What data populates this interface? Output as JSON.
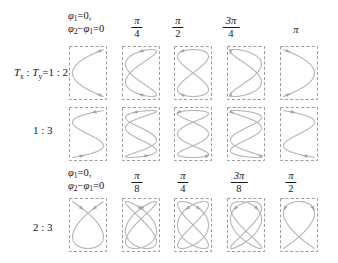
{
  "palette": {
    "curve": "#b7b7b7",
    "arrow": "#a5a5a5",
    "box_border": "#9b9b9b",
    "text": "#151515",
    "background": "#ffffff"
  },
  "phase_zero_note": {
    "phi": "φ",
    "sub_one": "1",
    "sub_two": "2",
    "line1_tail": "=0,",
    "minus": "−",
    "line2_tail": "=0"
  },
  "headers": {
    "top_fractions": [
      {
        "num": "π",
        "den": "4"
      },
      {
        "num": "π",
        "den": "2"
      },
      {
        "num": "3π",
        "den": "4"
      },
      {
        "num": "π",
        "den": ""
      }
    ],
    "bottom_fractions": [
      {
        "num": "π",
        "den": "8"
      },
      {
        "num": "π",
        "den": "4"
      },
      {
        "num": "3π",
        "den": "8"
      },
      {
        "num": "π",
        "den": "2"
      }
    ]
  },
  "row_labels": {
    "row1": {
      "T1": "T",
      "s1": "x",
      "colon": " : ",
      "T2": "T",
      "s2": "y",
      "tail": "=1 : 2"
    },
    "row2": "1 : 3",
    "row3": "2 : 3"
  },
  "curves": {
    "model": "x = cos(a*t + delta), y = cos(b*t)",
    "rows": [
      {
        "name": "ratio-1-2",
        "ratio": "1:2",
        "a": 2,
        "b": 1,
        "phase_labels": [
          "0",
          "π/4",
          "π/2",
          "3π/4",
          "π"
        ],
        "deltas_rad": [
          0,
          0.7853982,
          1.5707963,
          2.3561945,
          3.1415927
        ]
      },
      {
        "name": "ratio-1-3",
        "ratio": "1:3",
        "a": 3,
        "b": 1,
        "phase_labels": [
          "0",
          "π/4",
          "π/2",
          "3π/4",
          "π"
        ],
        "deltas_rad": [
          0,
          0.7853982,
          1.5707963,
          2.3561945,
          3.1415927
        ]
      },
      {
        "name": "ratio-2-3",
        "ratio": "2:3",
        "a": 3,
        "b": 2,
        "phase_labels": [
          "0",
          "π/8",
          "π/4",
          "3π/8",
          "π/2"
        ],
        "deltas_rad": [
          0,
          0.3926991,
          0.7853982,
          1.1780972,
          1.5707963
        ]
      }
    ]
  }
}
